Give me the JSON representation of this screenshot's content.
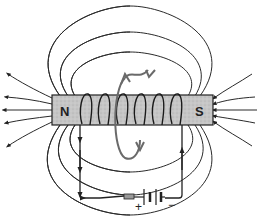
{
  "diagram": {
    "magnet": {
      "north_label": "N",
      "south_label": "S",
      "fill_color": "#c8c8c8"
    },
    "battery": {
      "positive_label": "+",
      "negative_label": "−"
    },
    "colors": {
      "field_lines": "#2a2a2a",
      "curl_arrow": "#6a6a6a",
      "background": "#ffffff"
    }
  }
}
